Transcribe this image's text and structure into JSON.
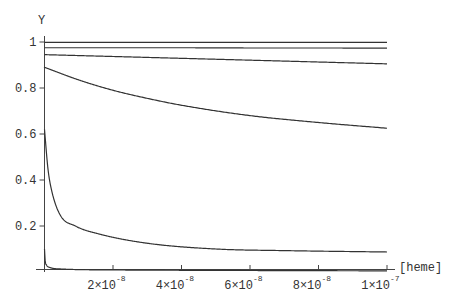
{
  "chart_data": {
    "type": "line",
    "title": "",
    "xlabel": "[heme]",
    "ylabel": "Y",
    "xlim": [
      0,
      1e-07
    ],
    "ylim": [
      0,
      1
    ],
    "grid": false,
    "legend": null,
    "x_ticks": [
      {
        "value": 2e-08,
        "mantissa": "2×10",
        "exp": "-8"
      },
      {
        "value": 4e-08,
        "mantissa": "4×10",
        "exp": "-8"
      },
      {
        "value": 6e-08,
        "mantissa": "6×10",
        "exp": "-8"
      },
      {
        "value": 8e-08,
        "mantissa": "8×10",
        "exp": "-8"
      },
      {
        "value": 1e-07,
        "mantissa": "1×10",
        "exp": "-7"
      }
    ],
    "y_ticks": [
      {
        "value": 0.2,
        "label": "0.2"
      },
      {
        "value": 0.4,
        "label": "0.4"
      },
      {
        "value": 0.6,
        "label": "0.6"
      },
      {
        "value": 0.8,
        "label": "0.8"
      },
      {
        "value": 1.0,
        "label": "1"
      }
    ],
    "series": [
      {
        "name": "curve-1",
        "x": [
          0,
          2e-08,
          4e-08,
          6e-08,
          8e-08,
          1e-07
        ],
        "y": [
          0.998,
          0.998,
          0.998,
          0.998,
          0.998,
          0.998
        ]
      },
      {
        "name": "curve-2",
        "x": [
          0,
          2e-08,
          4e-08,
          6e-08,
          8e-08,
          1e-07
        ],
        "y": [
          0.975,
          0.975,
          0.975,
          0.974,
          0.974,
          0.973
        ]
      },
      {
        "name": "curve-3",
        "x": [
          0,
          2e-08,
          4e-08,
          6e-08,
          8e-08,
          1e-07
        ],
        "y": [
          0.945,
          0.937,
          0.929,
          0.921,
          0.913,
          0.905
        ]
      },
      {
        "name": "curve-4",
        "x": [
          0,
          1e-08,
          2e-08,
          3e-08,
          4e-08,
          6e-08,
          8e-08,
          1e-07
        ],
        "y": [
          0.89,
          0.835,
          0.79,
          0.755,
          0.725,
          0.68,
          0.65,
          0.625
        ]
      },
      {
        "name": "curve-5",
        "x": [
          0,
          1e-09,
          2e-09,
          4.5e-09,
          9e-09,
          1.6e-08,
          3e-08,
          5e-08,
          7e-08,
          1e-07
        ],
        "y": [
          0.62,
          0.45,
          0.36,
          0.25,
          0.2,
          0.165,
          0.125,
          0.1,
          0.093,
          0.087
        ]
      },
      {
        "name": "curve-6",
        "x": [
          0,
          2e-10,
          6e-10,
          1.5e-09,
          5e-09,
          2e-08,
          5e-08,
          1e-07
        ],
        "y": [
          0.1,
          0.05,
          0.03,
          0.02,
          0.013,
          0.009,
          0.007,
          0.005
        ]
      }
    ]
  }
}
